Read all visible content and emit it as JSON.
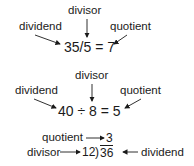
{
  "diagram1": {
    "divisor_label": "divisor",
    "dividend_label": "dividend",
    "quotient_label": "quotient",
    "equation": "35/5 = 7"
  },
  "diagram2": {
    "divisor_label": "divisor",
    "dividend_label": "dividend",
    "quotient_label": "quotient",
    "equation": "40 ÷ 8 = 5"
  },
  "diagram3": {
    "quotient_label": "quotient",
    "quotient_value": "3",
    "divisor_label": "divisor",
    "divisor_value": "12",
    "bracket": ")",
    "dividend_value": "36",
    "dividend_label": "dividend"
  }
}
